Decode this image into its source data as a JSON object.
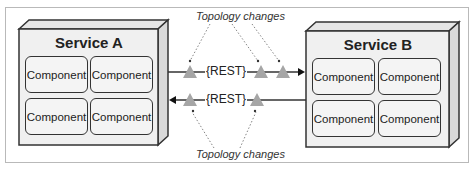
{
  "diagram": {
    "services": [
      {
        "name": "Service A",
        "components": [
          "Component",
          "Component",
          "Component",
          "Component"
        ]
      },
      {
        "name": "Service B",
        "components": [
          "Component",
          "Component",
          "Component",
          "Component"
        ]
      }
    ],
    "connections": [
      {
        "label": "{REST}",
        "direction": "A-to-B",
        "nodes": 3
      },
      {
        "label": "{REST}",
        "direction": "B-to-A",
        "nodes": 2
      }
    ],
    "annotations": {
      "top": "Topology changes",
      "bottom": "Topology changes"
    },
    "colors": {
      "box_fill": "#f0f0f0",
      "box_stroke": "#333333",
      "triangle": "#a6a6a6",
      "frame": "#b9b9b9"
    }
  }
}
